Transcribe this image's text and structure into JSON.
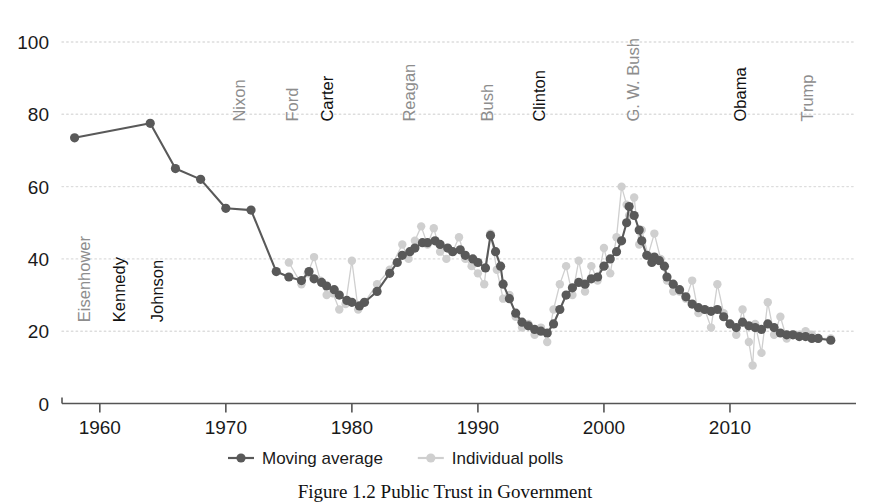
{
  "figure": {
    "caption": "Figure 1.2 Public Trust in Government"
  },
  "chart_data": {
    "type": "line",
    "title": "",
    "xlabel": "",
    "ylabel": "",
    "xlim": [
      1957,
      2020
    ],
    "ylim": [
      0,
      100
    ],
    "xticks": [
      1960,
      1970,
      1980,
      1990,
      2000,
      2010
    ],
    "yticks": [
      0,
      20,
      40,
      60,
      80,
      100
    ],
    "grid": "horizontal-dotted",
    "legend_position": "bottom-center",
    "colors": {
      "moving_average": "#595959",
      "individual_polls": "#cfcfcf",
      "axis": "#555555",
      "gridline": "#dddddd",
      "label_dark": "#111111",
      "label_light": "#8d8d8d",
      "background": "#ffffff"
    },
    "legend": [
      {
        "name": "Moving average",
        "color": "#595959",
        "marker": "line-dot"
      },
      {
        "name": "Individual polls",
        "color": "#cfcfcf",
        "marker": "line-dot"
      }
    ],
    "annotations": [
      {
        "label": "Eisenhower",
        "x": 1959.2,
        "y": 22.5,
        "style": "light",
        "orientation": "vertical"
      },
      {
        "label": "Kennedy",
        "x": 1962.0,
        "y": 22.5,
        "style": "dark",
        "orientation": "vertical"
      },
      {
        "label": "Johnson",
        "x": 1965.0,
        "y": 22.5,
        "style": "dark",
        "orientation": "vertical"
      },
      {
        "label": "Nixon",
        "x": 1971.5,
        "y": 78.0,
        "style": "light",
        "orientation": "vertical"
      },
      {
        "label": "Ford",
        "x": 1975.7,
        "y": 78.0,
        "style": "light",
        "orientation": "vertical"
      },
      {
        "label": "Carter",
        "x": 1978.5,
        "y": 78.0,
        "style": "dark",
        "orientation": "vertical"
      },
      {
        "label": "Reagan",
        "x": 1985.0,
        "y": 78.0,
        "style": "light",
        "orientation": "vertical"
      },
      {
        "label": "Bush",
        "x": 1991.2,
        "y": 78.0,
        "style": "light",
        "orientation": "vertical"
      },
      {
        "label": "Clinton",
        "x": 1995.3,
        "y": 78.0,
        "style": "dark",
        "orientation": "vertical"
      },
      {
        "label": "G. W. Bush",
        "x": 2002.8,
        "y": 78.0,
        "style": "light",
        "orientation": "vertical"
      },
      {
        "label": "Obama",
        "x": 2011.3,
        "y": 78.0,
        "style": "dark",
        "orientation": "vertical"
      },
      {
        "label": "Trump",
        "x": 2016.6,
        "y": 78.0,
        "style": "light",
        "orientation": "vertical"
      }
    ],
    "series": [
      {
        "name": "Individual polls",
        "color": "#cfcfcf",
        "points": [
          [
            1975.0,
            39.0
          ],
          [
            1976.0,
            33.0
          ],
          [
            1976.5,
            36.0
          ],
          [
            1977.0,
            40.5
          ],
          [
            1977.5,
            34.0
          ],
          [
            1978.0,
            30.0
          ],
          [
            1978.5,
            30.5
          ],
          [
            1979.0,
            26.0
          ],
          [
            1979.5,
            27.5
          ],
          [
            1980.0,
            39.5
          ],
          [
            1980.5,
            26.0
          ],
          [
            1981.0,
            28.0
          ],
          [
            1982.0,
            33.0
          ],
          [
            1983.0,
            37.0
          ],
          [
            1984.0,
            44.0
          ],
          [
            1984.5,
            40.0
          ],
          [
            1985.0,
            45.0
          ],
          [
            1985.5,
            49.0
          ],
          [
            1986.0,
            44.0
          ],
          [
            1986.5,
            48.5
          ],
          [
            1987.0,
            42.0
          ],
          [
            1987.5,
            40.0
          ],
          [
            1988.0,
            42.0
          ],
          [
            1988.5,
            46.0
          ],
          [
            1989.0,
            40.0
          ],
          [
            1989.5,
            38.0
          ],
          [
            1990.0,
            36.0
          ],
          [
            1990.5,
            33.0
          ],
          [
            1991.0,
            47.0
          ],
          [
            1991.5,
            37.0
          ],
          [
            1992.0,
            29.0
          ],
          [
            1992.5,
            30.0
          ],
          [
            1993.0,
            24.0
          ],
          [
            1993.5,
            21.0
          ],
          [
            1994.0,
            22.0
          ],
          [
            1994.5,
            19.0
          ],
          [
            1995.0,
            21.0
          ],
          [
            1995.5,
            17.0
          ],
          [
            1996.0,
            26.0
          ],
          [
            1996.5,
            33.0
          ],
          [
            1997.0,
            38.0
          ],
          [
            1997.5,
            30.0
          ],
          [
            1998.0,
            39.5
          ],
          [
            1998.5,
            31.0
          ],
          [
            1999.0,
            38.0
          ],
          [
            1999.5,
            34.0
          ],
          [
            2000.0,
            43.0
          ],
          [
            2000.5,
            36.0
          ],
          [
            2001.0,
            46.0
          ],
          [
            2001.4,
            60.0
          ],
          [
            2001.8,
            55.0
          ],
          [
            2002.0,
            52.0
          ],
          [
            2002.4,
            57.0
          ],
          [
            2002.8,
            44.0
          ],
          [
            2003.0,
            48.0
          ],
          [
            2003.5,
            41.0
          ],
          [
            2004.0,
            47.0
          ],
          [
            2004.5,
            40.0
          ],
          [
            2005.0,
            34.0
          ],
          [
            2005.5,
            31.0
          ],
          [
            2006.0,
            31.0
          ],
          [
            2006.5,
            29.0
          ],
          [
            2007.0,
            34.0
          ],
          [
            2007.5,
            25.0
          ],
          [
            2008.0,
            26.0
          ],
          [
            2008.5,
            21.0
          ],
          [
            2009.0,
            33.0
          ],
          [
            2009.5,
            25.0
          ],
          [
            2010.0,
            22.0
          ],
          [
            2010.5,
            19.0
          ],
          [
            2011.0,
            26.0
          ],
          [
            2011.5,
            17.0
          ],
          [
            2011.8,
            10.5
          ],
          [
            2012.0,
            22.0
          ],
          [
            2012.5,
            14.0
          ],
          [
            2013.0,
            28.0
          ],
          [
            2013.5,
            19.0
          ],
          [
            2014.0,
            24.0
          ],
          [
            2014.5,
            18.0
          ],
          [
            2015.0,
            19.0
          ],
          [
            2015.5,
            19.0
          ],
          [
            2016.0,
            20.0
          ],
          [
            2016.5,
            19.0
          ],
          [
            2017.0,
            18.0
          ],
          [
            2018.0,
            18.0
          ]
        ]
      },
      {
        "name": "Moving average",
        "color": "#595959",
        "points": [
          [
            1958.0,
            73.5
          ],
          [
            1964.0,
            77.5
          ],
          [
            1966.0,
            65.0
          ],
          [
            1968.0,
            62.0
          ],
          [
            1970.0,
            54.0
          ],
          [
            1972.0,
            53.5
          ],
          [
            1974.0,
            36.5
          ],
          [
            1975.0,
            35.0
          ],
          [
            1976.0,
            34.0
          ],
          [
            1976.6,
            36.5
          ],
          [
            1977.0,
            34.5
          ],
          [
            1977.6,
            33.5
          ],
          [
            1978.0,
            32.5
          ],
          [
            1978.6,
            31.5
          ],
          [
            1979.0,
            30.0
          ],
          [
            1979.6,
            28.5
          ],
          [
            1980.0,
            28.0
          ],
          [
            1980.6,
            27.0
          ],
          [
            1981.0,
            28.0
          ],
          [
            1982.0,
            31.0
          ],
          [
            1983.0,
            36.0
          ],
          [
            1983.6,
            39.0
          ],
          [
            1984.0,
            41.0
          ],
          [
            1984.6,
            42.0
          ],
          [
            1985.0,
            43.0
          ],
          [
            1985.6,
            44.5
          ],
          [
            1986.0,
            44.5
          ],
          [
            1986.6,
            45.0
          ],
          [
            1987.0,
            44.0
          ],
          [
            1987.6,
            43.0
          ],
          [
            1988.0,
            42.0
          ],
          [
            1988.6,
            42.5
          ],
          [
            1989.0,
            41.0
          ],
          [
            1989.6,
            40.0
          ],
          [
            1990.0,
            39.0
          ],
          [
            1990.6,
            37.5
          ],
          [
            1991.0,
            46.5
          ],
          [
            1991.4,
            42.0
          ],
          [
            1991.8,
            38.0
          ],
          [
            1992.0,
            33.0
          ],
          [
            1992.5,
            29.0
          ],
          [
            1993.0,
            25.0
          ],
          [
            1993.5,
            22.5
          ],
          [
            1994.0,
            21.5
          ],
          [
            1994.5,
            20.5
          ],
          [
            1995.0,
            20.0
          ],
          [
            1995.5,
            19.5
          ],
          [
            1996.0,
            22.0
          ],
          [
            1996.5,
            26.0
          ],
          [
            1997.0,
            30.0
          ],
          [
            1997.5,
            32.0
          ],
          [
            1998.0,
            33.5
          ],
          [
            1998.5,
            33.0
          ],
          [
            1999.0,
            34.5
          ],
          [
            1999.5,
            35.0
          ],
          [
            2000.0,
            38.0
          ],
          [
            2000.5,
            40.0
          ],
          [
            2001.0,
            42.0
          ],
          [
            2001.4,
            45.0
          ],
          [
            2001.8,
            50.0
          ],
          [
            2002.0,
            54.5
          ],
          [
            2002.4,
            52.0
          ],
          [
            2002.8,
            48.0
          ],
          [
            2003.0,
            45.0
          ],
          [
            2003.4,
            41.0
          ],
          [
            2003.8,
            39.0
          ],
          [
            2004.0,
            40.5
          ],
          [
            2004.4,
            39.5
          ],
          [
            2004.8,
            38.0
          ],
          [
            2005.0,
            35.0
          ],
          [
            2005.5,
            33.0
          ],
          [
            2006.0,
            31.5
          ],
          [
            2006.5,
            29.5
          ],
          [
            2007.0,
            27.5
          ],
          [
            2007.5,
            26.5
          ],
          [
            2008.0,
            26.0
          ],
          [
            2008.5,
            25.5
          ],
          [
            2009.0,
            26.0
          ],
          [
            2009.5,
            24.0
          ],
          [
            2010.0,
            22.0
          ],
          [
            2010.5,
            21.0
          ],
          [
            2011.0,
            22.5
          ],
          [
            2011.5,
            21.5
          ],
          [
            2012.0,
            21.0
          ],
          [
            2012.5,
            20.5
          ],
          [
            2013.0,
            22.0
          ],
          [
            2013.5,
            21.0
          ],
          [
            2014.0,
            19.5
          ],
          [
            2014.5,
            19.0
          ],
          [
            2015.0,
            19.0
          ],
          [
            2015.5,
            18.5
          ],
          [
            2016.0,
            18.5
          ],
          [
            2016.5,
            18.0
          ],
          [
            2017.0,
            18.0
          ],
          [
            2018.0,
            17.5
          ]
        ]
      }
    ]
  }
}
